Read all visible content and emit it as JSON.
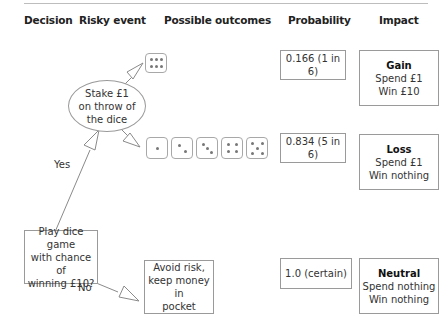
{
  "headers": {
    "decision": "Decision",
    "risky_event": "Risky event",
    "possible_outcomes": "Possible outcomes",
    "probability": "Probability",
    "impact": "Impact"
  },
  "decision_node": {
    "lines": [
      "Play dice game",
      "with chance of",
      "winning £10?"
    ]
  },
  "branches": {
    "yes": "Yes",
    "no": "No"
  },
  "risky_event": {
    "lines": [
      "Stake £1",
      "on throw of",
      "the dice"
    ]
  },
  "outcomes": [
    {
      "dice_faces": [
        6
      ],
      "probability": "0.166 (1 in 6)",
      "impact": {
        "title": "Gain",
        "lines": [
          "Spend £1",
          "Win £10"
        ]
      }
    },
    {
      "dice_faces": [
        1,
        2,
        3,
        4,
        5
      ],
      "probability": "0.834 (5 in 6)",
      "impact": {
        "title": "Loss",
        "lines": [
          "Spend £1",
          "Win nothing"
        ]
      }
    },
    {
      "avoid": [
        "Avoid risk,",
        "keep money in",
        "pocket"
      ],
      "probability": "1.0 (certain)",
      "impact": {
        "title": "Neutral",
        "lines": [
          "Spend nothing",
          "Win nothing"
        ]
      }
    }
  ]
}
